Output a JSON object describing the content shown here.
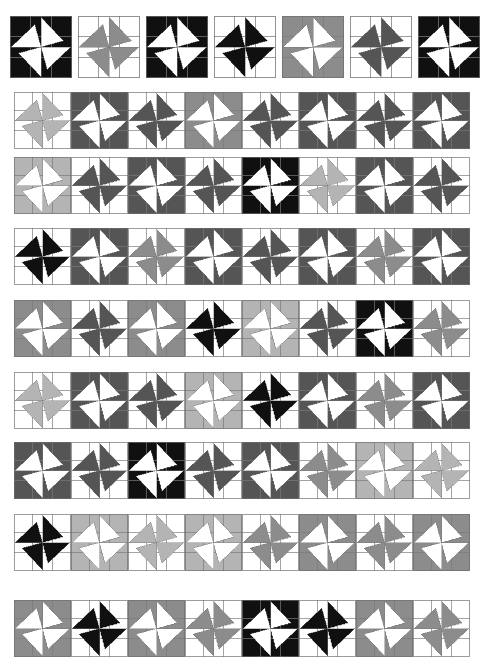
{
  "figure": {
    "canvas": {
      "width": 484,
      "height": 669
    },
    "background_color": "#ffffff"
  },
  "palette": {
    "names": [
      "white",
      "light-gray",
      "medium-gray",
      "dark-gray",
      "black"
    ],
    "white": "#ffffff",
    "light-gray": "#b4b4b4",
    "medium-gray": "#8c8c8c",
    "dark-gray": "#555555",
    "black": "#101010",
    "grid_line": "#7a7a7a",
    "tile_border": "#6e6e6e"
  },
  "legend": {
    "tone_labels": [
      "white",
      "light gray",
      "medium gray",
      "dark gray",
      "black"
    ],
    "tone_values": [
      "#ffffff",
      "#b4b4b4",
      "#8c8c8c",
      "#555555",
      "#101010"
    ]
  },
  "chart_data": {
    "type": "heatmap",
    "xlabel": "",
    "ylabel": "",
    "rows": 9,
    "tone_scale": [
      "#ffffff",
      "#b4b4b4",
      "#8c8c8c",
      "#555555",
      "#101010"
    ],
    "row_counts": [
      7,
      8,
      8,
      8,
      8,
      8,
      8,
      8,
      8
    ]
  },
  "rows": [
    {
      "index": 1,
      "x": 10,
      "y": 16,
      "tile": 62,
      "gap": 6,
      "count": 7,
      "tiles": [
        {
          "bg": "#101010",
          "star": "#ffffff",
          "flip": false
        },
        {
          "bg": "#ffffff",
          "star": "#8c8c8c",
          "flip": false
        },
        {
          "bg": "#101010",
          "star": "#ffffff",
          "flip": false
        },
        {
          "bg": "#ffffff",
          "star": "#101010",
          "flip": false
        },
        {
          "bg": "#8c8c8c",
          "star": "#ffffff",
          "flip": false
        },
        {
          "bg": "#ffffff",
          "star": "#555555",
          "flip": false
        },
        {
          "bg": "#101010",
          "star": "#ffffff",
          "flip": false
        }
      ]
    },
    {
      "index": 2,
      "x": 14,
      "y": 92,
      "tile": 57,
      "gap": 0,
      "count": 8,
      "tiles": [
        {
          "bg": "#ffffff",
          "star": "#b4b4b4",
          "flip": false
        },
        {
          "bg": "#555555",
          "star": "#ffffff",
          "flip": false
        },
        {
          "bg": "#ffffff",
          "star": "#555555",
          "flip": false
        },
        {
          "bg": "#8c8c8c",
          "star": "#ffffff",
          "flip": false
        },
        {
          "bg": "#ffffff",
          "star": "#555555",
          "flip": false
        },
        {
          "bg": "#555555",
          "star": "#ffffff",
          "flip": false
        },
        {
          "bg": "#ffffff",
          "star": "#555555",
          "flip": false
        },
        {
          "bg": "#555555",
          "star": "#ffffff",
          "flip": false
        }
      ]
    },
    {
      "index": 3,
      "x": 14,
      "y": 157,
      "tile": 57,
      "gap": 0,
      "count": 8,
      "tiles": [
        {
          "bg": "#b4b4b4",
          "star": "#ffffff",
          "flip": false
        },
        {
          "bg": "#ffffff",
          "star": "#555555",
          "flip": false
        },
        {
          "bg": "#555555",
          "star": "#ffffff",
          "flip": false
        },
        {
          "bg": "#ffffff",
          "star": "#555555",
          "flip": false
        },
        {
          "bg": "#101010",
          "star": "#ffffff",
          "flip": false
        },
        {
          "bg": "#ffffff",
          "star": "#b4b4b4",
          "flip": false
        },
        {
          "bg": "#555555",
          "star": "#ffffff",
          "flip": false
        },
        {
          "bg": "#ffffff",
          "star": "#555555",
          "flip": false
        }
      ]
    },
    {
      "index": 4,
      "x": 14,
      "y": 228,
      "tile": 57,
      "gap": 0,
      "count": 8,
      "tiles": [
        {
          "bg": "#ffffff",
          "star": "#101010",
          "flip": false
        },
        {
          "bg": "#555555",
          "star": "#ffffff",
          "flip": false
        },
        {
          "bg": "#ffffff",
          "star": "#8c8c8c",
          "flip": false
        },
        {
          "bg": "#555555",
          "star": "#ffffff",
          "flip": false
        },
        {
          "bg": "#ffffff",
          "star": "#555555",
          "flip": false
        },
        {
          "bg": "#555555",
          "star": "#ffffff",
          "flip": false
        },
        {
          "bg": "#ffffff",
          "star": "#8c8c8c",
          "flip": false
        },
        {
          "bg": "#555555",
          "star": "#ffffff",
          "flip": false
        }
      ]
    },
    {
      "index": 5,
      "x": 14,
      "y": 300,
      "tile": 57,
      "gap": 0,
      "count": 8,
      "tiles": [
        {
          "bg": "#8c8c8c",
          "star": "#ffffff",
          "flip": false
        },
        {
          "bg": "#ffffff",
          "star": "#555555",
          "flip": false
        },
        {
          "bg": "#8c8c8c",
          "star": "#ffffff",
          "flip": false
        },
        {
          "bg": "#ffffff",
          "star": "#101010",
          "flip": false
        },
        {
          "bg": "#b4b4b4",
          "star": "#ffffff",
          "flip": false
        },
        {
          "bg": "#ffffff",
          "star": "#555555",
          "flip": false
        },
        {
          "bg": "#101010",
          "star": "#ffffff",
          "flip": false
        },
        {
          "bg": "#ffffff",
          "star": "#8c8c8c",
          "flip": false
        }
      ]
    },
    {
      "index": 6,
      "x": 14,
      "y": 372,
      "tile": 57,
      "gap": 0,
      "count": 8,
      "tiles": [
        {
          "bg": "#ffffff",
          "star": "#b4b4b4",
          "flip": false
        },
        {
          "bg": "#555555",
          "star": "#ffffff",
          "flip": false
        },
        {
          "bg": "#ffffff",
          "star": "#555555",
          "flip": false
        },
        {
          "bg": "#b4b4b4",
          "star": "#ffffff",
          "flip": false
        },
        {
          "bg": "#ffffff",
          "star": "#101010",
          "flip": false
        },
        {
          "bg": "#555555",
          "star": "#ffffff",
          "flip": false
        },
        {
          "bg": "#ffffff",
          "star": "#8c8c8c",
          "flip": false
        },
        {
          "bg": "#555555",
          "star": "#ffffff",
          "flip": false
        }
      ]
    },
    {
      "index": 7,
      "x": 14,
      "y": 442,
      "tile": 57,
      "gap": 0,
      "count": 8,
      "tiles": [
        {
          "bg": "#555555",
          "star": "#ffffff",
          "flip": false
        },
        {
          "bg": "#ffffff",
          "star": "#555555",
          "flip": false
        },
        {
          "bg": "#101010",
          "star": "#ffffff",
          "flip": false
        },
        {
          "bg": "#ffffff",
          "star": "#555555",
          "flip": false
        },
        {
          "bg": "#555555",
          "star": "#ffffff",
          "flip": false
        },
        {
          "bg": "#ffffff",
          "star": "#8c8c8c",
          "flip": false
        },
        {
          "bg": "#b4b4b4",
          "star": "#ffffff",
          "flip": false
        },
        {
          "bg": "#ffffff",
          "star": "#b4b4b4",
          "flip": false
        }
      ]
    },
    {
      "index": 8,
      "x": 14,
      "y": 514,
      "tile": 57,
      "gap": 0,
      "count": 8,
      "tiles": [
        {
          "bg": "#ffffff",
          "star": "#101010",
          "flip": false
        },
        {
          "bg": "#b4b4b4",
          "star": "#ffffff",
          "flip": false
        },
        {
          "bg": "#ffffff",
          "star": "#b4b4b4",
          "flip": false
        },
        {
          "bg": "#b4b4b4",
          "star": "#ffffff",
          "flip": false
        },
        {
          "bg": "#ffffff",
          "star": "#8c8c8c",
          "flip": false
        },
        {
          "bg": "#8c8c8c",
          "star": "#ffffff",
          "flip": false
        },
        {
          "bg": "#ffffff",
          "star": "#8c8c8c",
          "flip": false
        },
        {
          "bg": "#8c8c8c",
          "star": "#ffffff",
          "flip": false
        }
      ]
    },
    {
      "index": 9,
      "x": 14,
      "y": 600,
      "tile": 57,
      "gap": 0,
      "count": 8,
      "tiles": [
        {
          "bg": "#8c8c8c",
          "star": "#ffffff",
          "flip": false
        },
        {
          "bg": "#ffffff",
          "star": "#101010",
          "flip": false
        },
        {
          "bg": "#8c8c8c",
          "star": "#ffffff",
          "flip": false
        },
        {
          "bg": "#ffffff",
          "star": "#8c8c8c",
          "flip": false
        },
        {
          "bg": "#101010",
          "star": "#ffffff",
          "flip": false
        },
        {
          "bg": "#ffffff",
          "star": "#101010",
          "flip": false
        },
        {
          "bg": "#8c8c8c",
          "star": "#ffffff",
          "flip": false
        },
        {
          "bg": "#ffffff",
          "star": "#8c8c8c",
          "flip": false
        }
      ]
    }
  ]
}
